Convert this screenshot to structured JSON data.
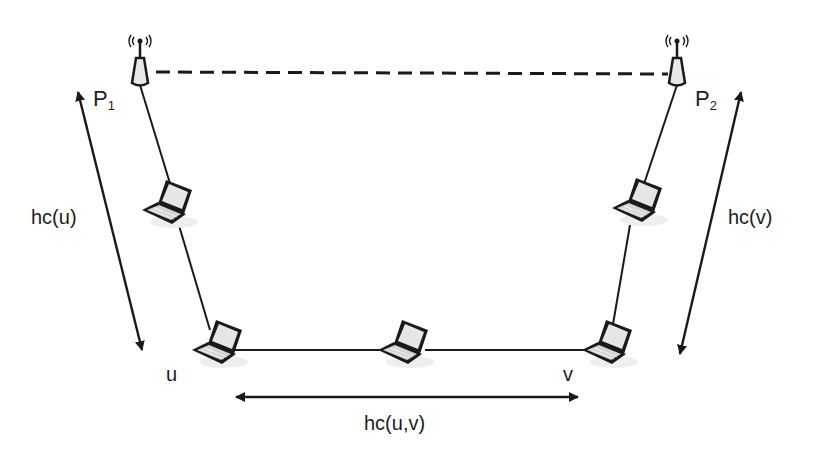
{
  "diagram": {
    "type": "wireless multi-hop network path",
    "nodes": {
      "p1": {
        "label": "P",
        "subscript": "1",
        "kind": "access-point"
      },
      "p2": {
        "label": "P",
        "subscript": "2",
        "kind": "access-point"
      },
      "u": {
        "label": "u",
        "kind": "laptop"
      },
      "v": {
        "label": "v",
        "kind": "laptop"
      },
      "left_relay": {
        "kind": "laptop"
      },
      "middle_relay": {
        "kind": "laptop"
      },
      "right_relay": {
        "kind": "laptop"
      }
    },
    "edges": [
      {
        "from": "p1",
        "to": "p2",
        "style": "dashed"
      },
      {
        "from": "p1",
        "to": "left_relay",
        "style": "solid"
      },
      {
        "from": "left_relay",
        "to": "u",
        "style": "solid"
      },
      {
        "from": "u",
        "to": "middle_relay",
        "style": "solid"
      },
      {
        "from": "middle_relay",
        "to": "v",
        "style": "solid"
      },
      {
        "from": "v",
        "to": "right_relay",
        "style": "solid"
      },
      {
        "from": "right_relay",
        "to": "p2",
        "style": "solid"
      }
    ],
    "measures": {
      "hc_u": "hc(u)",
      "hc_v": "hc(v)",
      "hc_uv": "hc(u,v)"
    },
    "colors": {
      "line": "#1a1a1a",
      "laptop_screen": "#e6e6e6",
      "laptop_keys": "#d0d0d0",
      "tower_fill": "#e8e8e8"
    }
  }
}
